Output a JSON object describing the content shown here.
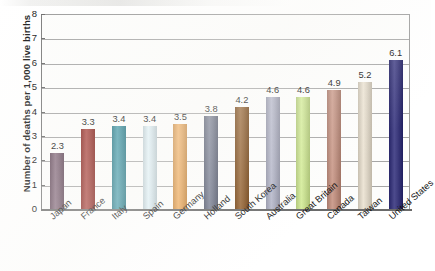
{
  "chart_data": {
    "type": "bar",
    "title": "",
    "subtitle": "",
    "xlabel": "",
    "ylabel": "Number of deaths per 1,000 live births",
    "ylim": [
      0,
      8
    ],
    "ytick_labels": [
      "8",
      "7",
      "6",
      "5",
      "4",
      "3",
      "2",
      "1",
      "0"
    ],
    "yticks": [
      8,
      7,
      6,
      5,
      4,
      3,
      2,
      1,
      0
    ],
    "grid": true,
    "legend": false,
    "categories": [
      "Japan",
      "France",
      "Italy",
      "Spain",
      "Germany",
      "Holland",
      "South Korea",
      "Australia",
      "Great Britain",
      "Canada",
      "Taiwan",
      "United States"
    ],
    "values": [
      2.3,
      3.3,
      3.4,
      3.4,
      3.5,
      3.8,
      4.2,
      4.6,
      4.6,
      4.9,
      5.2,
      6.1
    ],
    "value_labels": [
      "2.3",
      "3.3",
      "3.4",
      "3.4",
      "3.5",
      "3.8",
      "4.2",
      "4.6",
      "4.6",
      "4.9",
      "5.2",
      "6.1"
    ],
    "bar_colors": [
      "#7b6273",
      "#9c3a34",
      "#3b8d9c",
      "#d2e2e8",
      "#e0a158",
      "#6e7487",
      "#8a5a2b",
      "#a9abbd",
      "#c6dd8e",
      "#bd8f80",
      "#ddd5c6",
      "#3d3b7d"
    ],
    "axis_color": "#6a6a6a",
    "gridline_color": "#a6a6a6",
    "background_color": "#fdfdfc"
  }
}
